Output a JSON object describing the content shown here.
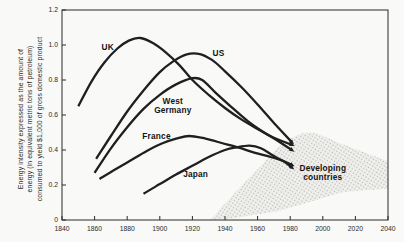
{
  "figure": {
    "background": "#f9f9f7",
    "line_color": "#1f1f1f",
    "frame_color": "#2a2a2a",
    "tick_label_color": "#2b2b2b",
    "stipple_dot_color": "#b7b7b7",
    "stipple_bg_color": "#efefec"
  },
  "chart_data": {
    "type": "line",
    "title": "",
    "xlabel": "",
    "ylabel_lines": [
      "Energy intensity expressed as the amount of",
      "energy (in equivalent metric tons of petroleum)",
      "consumed to yield $1,000 of gross domestic product"
    ],
    "xlim": [
      1840,
      2040
    ],
    "ylim": [
      0,
      1.2
    ],
    "grid": false,
    "legend": "labels drawn next to curves",
    "x_ticks": [
      1840,
      1860,
      1880,
      1900,
      1920,
      1940,
      1960,
      1980,
      2000,
      2020,
      2040
    ],
    "y_ticks": [
      {
        "v": 0,
        "label": "0"
      },
      {
        "v": 0.2,
        "label": "0.2"
      },
      {
        "v": 0.4,
        "label": "0.4"
      },
      {
        "v": 0.6,
        "label": "0.6"
      },
      {
        "v": 0.8,
        "label": "0.8"
      },
      {
        "v": 1.0,
        "label": "1.0"
      },
      {
        "v": 1.2,
        "label": "1.2"
      }
    ],
    "series": [
      {
        "name": "UK",
        "label_lines": [
          "UK"
        ],
        "label_at": [
          1868,
          0.99
        ],
        "points": [
          [
            1850,
            0.65
          ],
          [
            1858,
            0.79
          ],
          [
            1866,
            0.9
          ],
          [
            1874,
            0.98
          ],
          [
            1881,
            1.025
          ],
          [
            1888,
            1.04
          ],
          [
            1896,
            1.01
          ],
          [
            1904,
            0.955
          ],
          [
            1912,
            0.885
          ],
          [
            1920,
            0.8
          ],
          [
            1930,
            0.715
          ],
          [
            1940,
            0.64
          ],
          [
            1950,
            0.575
          ],
          [
            1960,
            0.52
          ],
          [
            1970,
            0.47
          ],
          [
            1981,
            0.43
          ]
        ]
      },
      {
        "name": "US",
        "label_lines": [
          "US"
        ],
        "label_at": [
          1936,
          0.955
        ],
        "points": [
          [
            1861,
            0.35
          ],
          [
            1870,
            0.48
          ],
          [
            1880,
            0.62
          ],
          [
            1890,
            0.74
          ],
          [
            1900,
            0.845
          ],
          [
            1908,
            0.905
          ],
          [
            1916,
            0.945
          ],
          [
            1924,
            0.95
          ],
          [
            1932,
            0.915
          ],
          [
            1940,
            0.85
          ],
          [
            1950,
            0.76
          ],
          [
            1960,
            0.66
          ],
          [
            1970,
            0.555
          ],
          [
            1981,
            0.445
          ]
        ]
      },
      {
        "name": "West Germany",
        "label_lines": [
          "West",
          "Germany"
        ],
        "label_at": [
          1908,
          0.655
        ],
        "points": [
          [
            1860,
            0.27
          ],
          [
            1870,
            0.41
          ],
          [
            1880,
            0.53
          ],
          [
            1890,
            0.635
          ],
          [
            1900,
            0.715
          ],
          [
            1910,
            0.775
          ],
          [
            1920,
            0.81
          ],
          [
            1926,
            0.8
          ],
          [
            1934,
            0.73
          ],
          [
            1944,
            0.645
          ],
          [
            1954,
            0.565
          ],
          [
            1964,
            0.5
          ],
          [
            1972,
            0.455
          ],
          [
            1981,
            0.4
          ]
        ]
      },
      {
        "name": "France",
        "label_lines": [
          "France"
        ],
        "label_at": [
          1898,
          0.48
        ],
        "points": [
          [
            1863,
            0.235
          ],
          [
            1872,
            0.285
          ],
          [
            1882,
            0.34
          ],
          [
            1892,
            0.395
          ],
          [
            1902,
            0.44
          ],
          [
            1910,
            0.465
          ],
          [
            1918,
            0.48
          ],
          [
            1928,
            0.465
          ],
          [
            1938,
            0.44
          ],
          [
            1948,
            0.415
          ],
          [
            1958,
            0.385
          ],
          [
            1968,
            0.36
          ],
          [
            1975,
            0.34
          ],
          [
            1981,
            0.315
          ]
        ]
      },
      {
        "name": "Japan",
        "label_lines": [
          "Japan"
        ],
        "label_at": [
          1922,
          0.265
        ],
        "points": [
          [
            1890,
            0.15
          ],
          [
            1900,
            0.205
          ],
          [
            1910,
            0.26
          ],
          [
            1920,
            0.31
          ],
          [
            1930,
            0.36
          ],
          [
            1940,
            0.4
          ],
          [
            1947,
            0.415
          ],
          [
            1955,
            0.425
          ],
          [
            1962,
            0.41
          ],
          [
            1970,
            0.365
          ],
          [
            1976,
            0.335
          ],
          [
            1981,
            0.3
          ]
        ]
      }
    ],
    "band": {
      "name": "Developing countries",
      "label_lines": [
        "Developing",
        "countries"
      ],
      "label_at": [
        2000,
        0.27
      ],
      "upper": [
        [
          1931,
          0.0
        ],
        [
          1946,
          0.155
        ],
        [
          1961,
          0.3
        ],
        [
          1976,
          0.44
        ],
        [
          1992,
          0.5
        ],
        [
          2010,
          0.44
        ],
        [
          2026,
          0.385
        ],
        [
          2040,
          0.335
        ]
      ],
      "lower": [
        [
          1931,
          0.0
        ],
        [
          1945,
          0.01
        ],
        [
          1958,
          0.03
        ],
        [
          1972,
          0.05
        ],
        [
          1986,
          0.085
        ],
        [
          2000,
          0.125
        ],
        [
          2014,
          0.16
        ],
        [
          2040,
          0.178
        ]
      ]
    }
  }
}
